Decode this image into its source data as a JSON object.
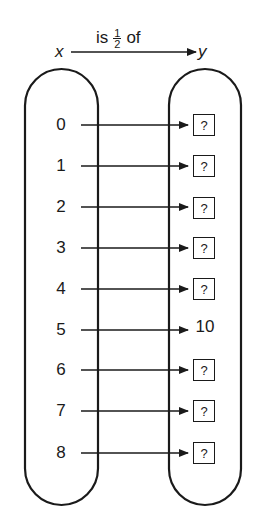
{
  "header": {
    "domain_var": "x",
    "codomain_var": "y",
    "relation_prefix": "is",
    "fraction_numerator": "1",
    "fraction_denominator": "2",
    "relation_suffix": "of"
  },
  "mapping": {
    "rows": [
      {
        "x": "0",
        "y": "?",
        "y_is_box": true
      },
      {
        "x": "1",
        "y": "?",
        "y_is_box": true
      },
      {
        "x": "2",
        "y": "?",
        "y_is_box": true
      },
      {
        "x": "3",
        "y": "?",
        "y_is_box": true
      },
      {
        "x": "4",
        "y": "?",
        "y_is_box": true
      },
      {
        "x": "5",
        "y": "10",
        "y_is_box": false
      },
      {
        "x": "6",
        "y": "?",
        "y_is_box": true
      },
      {
        "x": "7",
        "y": "?",
        "y_is_box": true
      },
      {
        "x": "8",
        "y": "?",
        "y_is_box": true
      }
    ]
  },
  "colors": {
    "ink": "#1a1a1a",
    "background": "#ffffff"
  }
}
